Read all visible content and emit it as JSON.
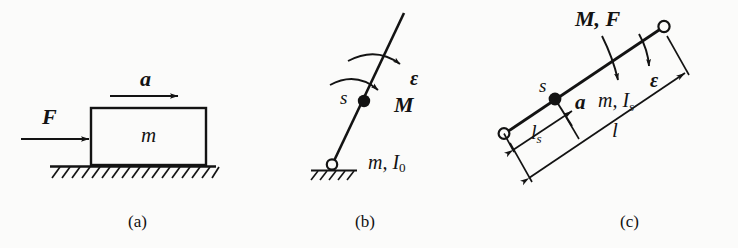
{
  "figure": {
    "background_color": "#fbfbfa",
    "ink_color": "#131313",
    "panel_count": 3
  },
  "panels": [
    {
      "id": "a",
      "caption": "(a)",
      "description": "Block of mass m on ground, pushed by force F, accelerating with a",
      "labels": {
        "force": "F",
        "acceleration": "a",
        "mass": "m"
      }
    },
    {
      "id": "b",
      "caption": "(b)",
      "description": "Rod pinned at base, moment M applied, angular acceleration epsilon, center of mass s",
      "labels": {
        "moment": "M",
        "angular_acceleration": "ε",
        "center_of_mass": "s",
        "mass_inertia": "m, I",
        "mass_inertia_sub": "0"
      }
    },
    {
      "id": "c",
      "caption": "(c)",
      "description": "Free bar with moment M and force F, accelerations a and epsilon, dimensions l and l_s",
      "labels": {
        "moment_force": "M, F",
        "angular_acceleration": "ε",
        "acceleration": "a",
        "center_of_mass": "s",
        "mass_inertia": "m, I",
        "mass_inertia_sub": "s",
        "length_total": "l",
        "length_partial": "l",
        "length_partial_sub": "s"
      }
    }
  ]
}
